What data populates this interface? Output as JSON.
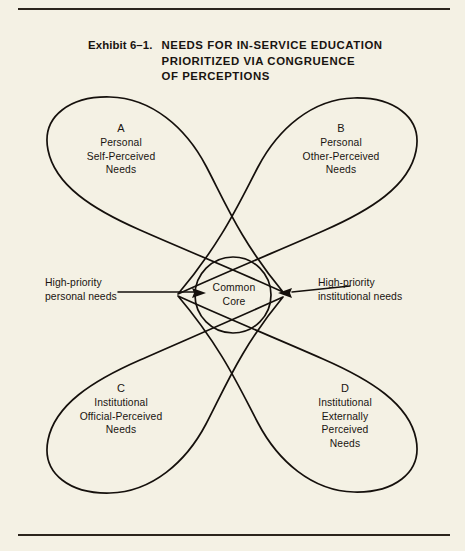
{
  "figure": {
    "exhibit_number": "Exhibit 6–1.",
    "title_lines": [
      "NEEDS FOR IN-SERVICE EDUCATION",
      "PRIORITIZED VIA CONGRUENCE",
      "OF PERCEPTIONS"
    ],
    "line_color": "#15100c",
    "background_color": "#f4f1e4"
  },
  "diagram": {
    "type": "venn-petal-diagram",
    "center_label": {
      "line1": "Common",
      "line2": "Core"
    },
    "petals": [
      {
        "letter": "A",
        "position": "top-left",
        "lines": [
          "Personal",
          "Self-Perceived",
          "Needs"
        ]
      },
      {
        "letter": "B",
        "position": "top-right",
        "lines": [
          "Personal",
          "Other-Perceived",
          "Needs"
        ]
      },
      {
        "letter": "C",
        "position": "bottom-left",
        "lines": [
          "Institutional",
          "Official-Perceived",
          "Needs"
        ]
      },
      {
        "letter": "D",
        "position": "bottom-right",
        "lines": [
          "Institutional",
          "Externally",
          "Perceived",
          "Needs"
        ]
      }
    ],
    "annotations": [
      {
        "id": "left",
        "lines": [
          "High-priority",
          "personal needs"
        ],
        "arrow_direction": "right"
      },
      {
        "id": "right",
        "lines": [
          "High-priority",
          "institutional needs"
        ],
        "arrow_direction": "left"
      }
    ]
  }
}
